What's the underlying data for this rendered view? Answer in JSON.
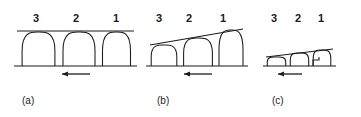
{
  "figure": {
    "background_color": "#ffffff",
    "stroke_color": "#1b1b1b",
    "width": 361,
    "height": 117,
    "panels": [
      {
        "caption": "(a)",
        "caption_x": 22,
        "caption_y": 96,
        "origin_x": 0,
        "baseline_y": 66,
        "baseline_x1": 14,
        "baseline_x2": 137,
        "envelope": {
          "x1": 17,
          "y1": 31,
          "x2": 134,
          "y2": 31,
          "type": "horizontal"
        },
        "arrow": {
          "x_tail": 90,
          "x_head": 62,
          "y": 74,
          "direction": "left"
        },
        "arches": [
          {
            "label": "3",
            "label_x": 33,
            "label_y": 13,
            "base_left": 18,
            "base_right": 59,
            "apex_x": 38,
            "apex_y": 32
          },
          {
            "label": "2",
            "label_x": 73,
            "label_y": 13,
            "base_left": 59,
            "base_right": 99,
            "apex_x": 79,
            "apex_y": 32
          },
          {
            "label": "1",
            "label_x": 113,
            "label_y": 13,
            "base_left": 99,
            "base_right": 134,
            "apex_x": 118,
            "apex_y": 32
          }
        ],
        "notch": null
      },
      {
        "caption": "(b)",
        "caption_x": 157,
        "caption_y": 96,
        "origin_x": 0,
        "baseline_y": 66,
        "baseline_x1": 146,
        "baseline_x2": 248,
        "envelope": {
          "x1": 150,
          "y1": 45,
          "x2": 243,
          "y2": 29,
          "type": "sloped-up"
        },
        "arrow": {
          "x_tail": 212,
          "x_head": 184,
          "y": 74,
          "direction": "left"
        },
        "arches": [
          {
            "label": "3",
            "label_x": 156,
            "label_y": 13,
            "base_left": 148,
            "base_right": 180,
            "apex_x": 160,
            "apex_y": 45
          },
          {
            "label": "2",
            "label_x": 186,
            "label_y": 13,
            "base_left": 180,
            "base_right": 216,
            "apex_x": 194,
            "apex_y": 38
          },
          {
            "label": "1",
            "label_x": 220,
            "label_y": 13,
            "base_left": 216,
            "base_right": 246,
            "apex_x": 231,
            "apex_y": 30
          }
        ],
        "notch": null
      },
      {
        "caption": "(c)",
        "caption_x": 272,
        "caption_y": 96,
        "origin_x": 0,
        "baseline_y": 66,
        "baseline_x1": 263,
        "baseline_x2": 336,
        "envelope": {
          "x1": 266,
          "y1": 57,
          "x2": 333,
          "y2": 49,
          "type": "sloped-up"
        },
        "arrow": {
          "x_tail": 302,
          "x_head": 278,
          "y": 74,
          "direction": "left"
        },
        "arches": [
          {
            "label": "3",
            "label_x": 271,
            "label_y": 13,
            "base_left": 265,
            "base_right": 288,
            "apex_x": 274,
            "apex_y": 57
          },
          {
            "label": "2",
            "label_x": 295,
            "label_y": 13,
            "base_left": 288,
            "base_right": 311,
            "apex_x": 298,
            "apex_y": 53
          },
          {
            "label": "1",
            "label_x": 318,
            "label_y": 13,
            "base_left": 311,
            "base_right": 333,
            "apex_x": 323,
            "apex_y": 50
          }
        ],
        "notch": {
          "x1": 313,
          "x2": 319,
          "y_top": 57,
          "present": true
        }
      }
    ]
  }
}
